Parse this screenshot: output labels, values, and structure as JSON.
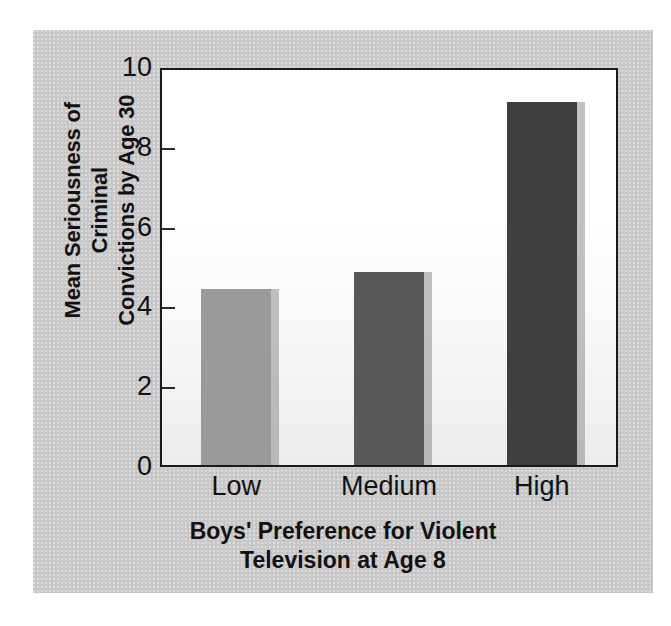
{
  "chart_data": {
    "type": "bar",
    "title": "",
    "subtitle": "",
    "categories": [
      "Low",
      "Medium",
      "High"
    ],
    "values": [
      4.4,
      4.85,
      9.1
    ],
    "series": [
      {
        "name": "Mean Seriousness of Criminal Convictions by Age 30",
        "values": [
          4.4,
          4.85,
          9.1
        ]
      }
    ],
    "xlabel": "Boys' Preference for Violent Television at Age 8",
    "xlabel_lines": [
      "Boys' Preference for Violent",
      "Television at Age 8"
    ],
    "ylabel": "Mean Seriousness of Criminal Convictions by Age 30",
    "ylabel_lines": [
      "Mean Seriousness of Criminal",
      "Convictions by Age 30"
    ],
    "ylim": [
      0,
      10
    ],
    "yticks": [
      0,
      2,
      4,
      6,
      8,
      10
    ],
    "ytick_labels": [
      "0",
      "2",
      "4",
      "6",
      "8",
      "10"
    ],
    "grid": false,
    "legend": false,
    "legend_position": "none",
    "bar_colors": [
      "#9a9a9a",
      "#585858",
      "#3f3f3f"
    ],
    "annotations": []
  },
  "figure": {
    "panel_background": "#c8c8c8",
    "plot_background": "#ffffff",
    "axis_color": "#1a1a1a",
    "text_color": "#111111"
  }
}
